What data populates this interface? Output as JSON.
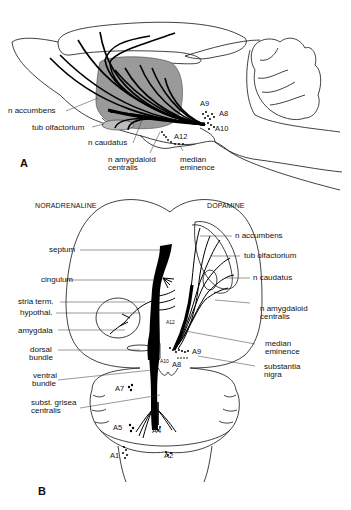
{
  "figure": {
    "panel_a": {
      "letter": "A",
      "view": "sagittal",
      "labels": {
        "n_accumbens": "n accumbens",
        "tub_olfactorium": "tub olfactorium",
        "n_caudatus": "n caudatus",
        "n_amygdaloid_line1": "n amygdaloid",
        "n_amygdaloid_line2": "centralis",
        "median_line1": "median",
        "median_line2": "eminence"
      },
      "nuclei": {
        "a9": "A9",
        "a8": "A8",
        "a10": "A10",
        "a12": "A12"
      }
    },
    "panel_b": {
      "letter": "B",
      "view": "horizontal",
      "headers": {
        "left": "NORADRENALINE",
        "right": "DOPAMINE"
      },
      "left_labels": {
        "septum": "septum",
        "cingulum": "cingulum",
        "stria_term": "stria term.",
        "hypothal": "hypothal.",
        "amygdala": "amygdala",
        "dorsal_line1": "dorsal",
        "dorsal_line2": "bundle",
        "ventral_line1": "ventral",
        "ventral_line2": "bundle",
        "subst_line1": "subst. grisea",
        "subst_line2": "centralis"
      },
      "right_labels": {
        "n_accumbens": "n accumbens",
        "tub_olfactorium": "tub olfactorium",
        "n_caudatus": "n caudatus",
        "n_amygdaloid_line1": "n amygdaloid",
        "n_amygdaloid_line2": "centralis",
        "median_line1": "median",
        "median_line2": "eminence",
        "substantia_line1": "substantia",
        "substantia_line2": "nigra"
      },
      "nuclei": {
        "a12": "A12",
        "a9": "A9",
        "a10": "A10",
        "a8": "A8",
        "a7": "A7",
        "a6": "A6",
        "a5": "A5",
        "a4": "A4",
        "a1": "A1",
        "a2": "A2"
      }
    }
  }
}
